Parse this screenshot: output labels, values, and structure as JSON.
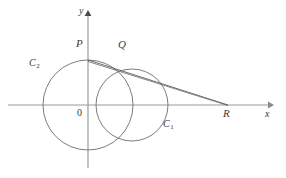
{
  "figure": {
    "width": 286,
    "height": 178,
    "background": "#ffffff",
    "stroke_color": "#5a5a5a",
    "axis_color": "#8a8a8a",
    "label_color": "#3a3a3a"
  },
  "axes": {
    "origin": {
      "x": 88,
      "y": 105
    },
    "x_axis": {
      "label": "x",
      "label_x": 266,
      "label_y": 111,
      "start_x": 8,
      "end_x": 272,
      "y": 105,
      "arrow": "right"
    },
    "y_axis": {
      "label": "y",
      "label_x": 79,
      "label_y": 8,
      "x": 88,
      "start_y": 168,
      "end_y": 12,
      "arrow": "up"
    },
    "origin_label": {
      "text": "0",
      "x": 78,
      "y": 109
    }
  },
  "circles": [
    {
      "name": "C1",
      "label": "C",
      "subscript": "1",
      "cx": 132,
      "cy": 105,
      "r": 36,
      "label_x": 164,
      "label_y": 123
    },
    {
      "name": "C2",
      "label": "C",
      "subscript": "2",
      "cx": 88,
      "cy": 105,
      "r": 45,
      "label_x": 31,
      "label_y": 62
    }
  ],
  "points": [
    {
      "name": "P",
      "label": "P",
      "x": 88,
      "y": 60,
      "label_x": 76,
      "label_y": 40
    },
    {
      "name": "Q",
      "label": "Q",
      "x": 122,
      "y": 72,
      "label_x": 119,
      "label_y": 41
    },
    {
      "name": "R",
      "label": "R",
      "x": 228,
      "y": 105,
      "label_x": 224,
      "label_y": 110
    }
  ],
  "lines": [
    {
      "name": "line-PR",
      "from": "P",
      "to": "R",
      "x1": 88,
      "y1": 60,
      "x2": 228,
      "y2": 105
    },
    {
      "name": "line-PQ-secondary",
      "from": "P",
      "to": "tangent-point",
      "x1": 88,
      "y1": 60,
      "x2": 228,
      "y2": 105
    }
  ]
}
